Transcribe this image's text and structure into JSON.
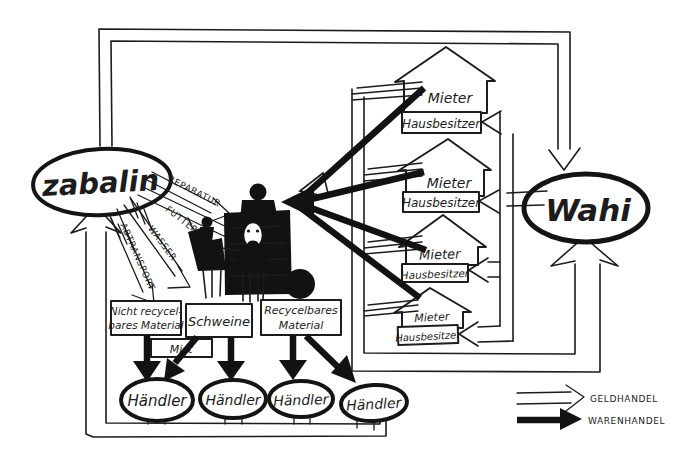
{
  "actors": {
    "zabalin": "zabalin",
    "wahi": "Wahi"
  },
  "houses": [
    {
      "tenant": "Mieter",
      "owner": "Hausbesitzer"
    },
    {
      "tenant": "Mieter",
      "owner": "Hausbesitzer"
    },
    {
      "tenant": "Mieter",
      "owner": "Hausbesitzer"
    },
    {
      "tenant": "Mieter",
      "owner": "Hausbesitzer"
    }
  ],
  "services": {
    "repair": "REPARATUR",
    "feed": "FUTTER",
    "water": "WASSER",
    "removal": "ABTRANSPORT"
  },
  "materials": {
    "non_recyclable_line1": "Nicht recycel-",
    "non_recyclable_line2": "bares Material",
    "pigs": "Schweine",
    "recyclable_line1": "Recycelbares",
    "recyclable_line2": "Material",
    "manure": "Mist"
  },
  "traders": [
    {
      "label": "Händler"
    },
    {
      "label": "Händler"
    },
    {
      "label": "Händler"
    },
    {
      "label": "Händler"
    }
  ],
  "legend": {
    "money": "GELDHANDEL",
    "goods": "WARENHANDEL"
  },
  "colors": {
    "ink": "#1c1c1c",
    "paper": "#ffffff"
  }
}
